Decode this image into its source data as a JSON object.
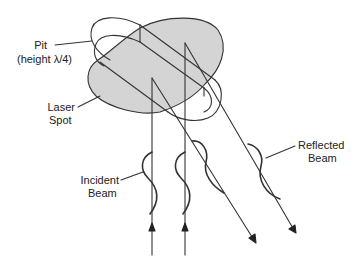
{
  "diagram": {
    "labels": {
      "pit_line1": "Pit",
      "pit_line2": "(height λ/4)",
      "spot_line1": "Laser",
      "spot_line2": "Spot",
      "incident_line1": "Incident",
      "incident_line2": "Beam",
      "reflected_line1": "Reflected",
      "reflected_line2": "Beam"
    },
    "colors": {
      "spot_fill": "#d4d4d4",
      "stroke": "#333333",
      "background": "#ffffff"
    }
  }
}
